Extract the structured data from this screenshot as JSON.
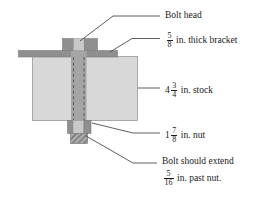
{
  "figure": {
    "background": "#ffffff",
    "line_color": "#5a5a5a",
    "text_color": "#1a1a1a"
  },
  "colors": {
    "bolt_head_center": "#c9c9c9",
    "bolt_head_side": "#8f8f8f",
    "bracket": "#8f8f8f",
    "stock": "#d8d8d8",
    "bolt_shaft": "#a0a0a0",
    "nut_center": "#c9c9c9",
    "nut_side": "#8f8f8f",
    "bolt_extension": "#9a9a9a",
    "dashed_line": "#6a6a6a",
    "outline": "#7a7a7a"
  },
  "parts": [
    {
      "name": "bolt-head",
      "fill": "#c9c9c9"
    },
    {
      "name": "bracket",
      "fill": "#8f8f8f"
    },
    {
      "name": "stock",
      "fill": "#d8d8d8"
    },
    {
      "name": "bolt-shaft",
      "fill": "#a0a0a0"
    },
    {
      "name": "nut",
      "fill": "#c9c9c9"
    },
    {
      "name": "bolt-extension",
      "fill": "#9a9a9a"
    }
  ],
  "labels": {
    "bolt_head": {
      "text": "Bolt head"
    },
    "bracket": {
      "fraction": {
        "numerator": "5",
        "denominator": "8"
      },
      "text": "in. thick bracket"
    },
    "stock": {
      "whole": "4",
      "fraction": {
        "numerator": "3",
        "denominator": "4"
      },
      "text": "in. stock"
    },
    "nut": {
      "whole": "1",
      "fraction": {
        "numerator": "7",
        "denominator": "8"
      },
      "text": "in. nut"
    },
    "extension": {
      "line1": "Bolt should extend",
      "fraction": {
        "numerator": "5",
        "denominator": "16"
      },
      "line2": "in. past nut."
    }
  }
}
